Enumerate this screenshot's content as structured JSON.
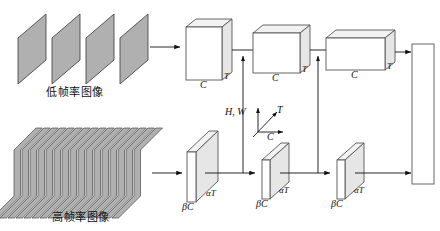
{
  "diagram": {
    "colors": {
      "frame_fill": "#b0b0b0",
      "frame_stroke": "#4a4a4a",
      "box_fill": "#ffffff",
      "box_stroke": "#555555",
      "top_face_fill": "#f2f2f2",
      "side_face_fill": "#e6e6e6",
      "arrow": "#111111",
      "background": "#ffffff"
    },
    "pathways": {
      "slow": {
        "input_label": "低帧率图像",
        "frame_count": 4,
        "stages": [
          {
            "channel_label": "C",
            "time_label": "T"
          },
          {
            "channel_label": "C",
            "time_label": "T"
          },
          {
            "channel_label": "C",
            "time_label": "T"
          }
        ]
      },
      "fast": {
        "input_label": "高帧率图像",
        "frame_count": 16,
        "stages": [
          {
            "channel_label": "βC",
            "time_label": "αT"
          },
          {
            "channel_label": "βC",
            "time_label": "αT"
          },
          {
            "channel_label": "βC",
            "time_label": "αT"
          }
        ]
      }
    },
    "axes_legend": {
      "vertical_label": "H, W",
      "depth_label": "T",
      "horizontal_label": "C"
    },
    "fusion_connection_count": 2,
    "output": {
      "label": ""
    }
  }
}
